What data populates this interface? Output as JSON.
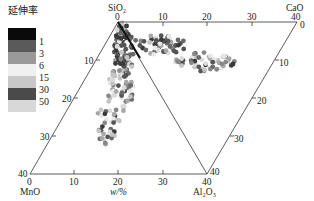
{
  "chart_data": {
    "type": "scatter",
    "subtype": "ternary-like (four-oxide projection)",
    "title": "",
    "legend": {
      "title": "延伸率",
      "position": "top-left",
      "entries": [
        {
          "label": "",
          "color": "#0a0a0a"
        },
        {
          "label": "1",
          "color": "#5a5a5a"
        },
        {
          "label": "3",
          "color": "#9a9a9a"
        },
        {
          "label": "6",
          "color": "#f2f2f2"
        },
        {
          "label": "15",
          "color": "#c8c8c8"
        },
        {
          "label": "30",
          "color": "#4a4a4a"
        },
        {
          "label": "50",
          "color": "#d6d6d6"
        }
      ],
      "bin_edges": [
        "1",
        "3",
        "6",
        "15",
        "30",
        "50"
      ]
    },
    "vertices": {
      "top_left": "SiO2",
      "top_right": "CaO",
      "bottom_left": "MnO",
      "bottom_right": "Al2O3"
    },
    "axes": {
      "top": {
        "label": "SiO2 → CaO",
        "ticks": [
          "0",
          "10",
          "20",
          "30",
          "40"
        ]
      },
      "left": {
        "label": "SiO2 → MnO",
        "ticks": [
          "10",
          "20",
          "30",
          "40"
        ]
      },
      "right": {
        "label": "CaO → Al2O3",
        "ticks": [
          "0",
          "10",
          "20",
          "30",
          "40"
        ]
      },
      "bottom": {
        "label": "w/%",
        "ticks": [
          "0",
          "10",
          "20",
          "30",
          "40"
        ]
      }
    },
    "xlabel": "w/%",
    "range": [
      0,
      40
    ],
    "grid": false
  },
  "labels": {
    "sio2": "SiO₂",
    "cao": "CaO",
    "mno": "MnO",
    "al2o3": "Al₂O₃",
    "xlabel": "w/%",
    "legend_title": "延伸率",
    "legend_labels": [
      "1",
      "3",
      "6",
      "15",
      "30",
      "50"
    ],
    "top_ticks": [
      "0",
      "10",
      "20",
      "30",
      "40"
    ],
    "left_ticks": [
      "10",
      "20",
      "30",
      "40"
    ],
    "right_ticks": [
      "0",
      "10",
      "20",
      "30",
      "40"
    ],
    "bottom_ticks": [
      "0",
      "10",
      "20",
      "30",
      "40"
    ]
  }
}
